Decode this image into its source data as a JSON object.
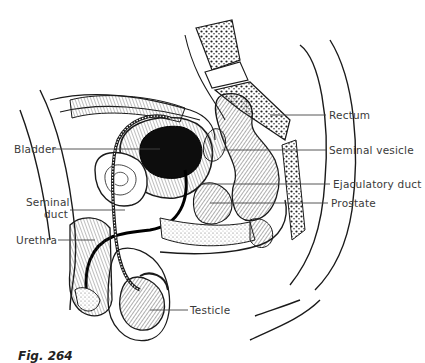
{
  "figure": {
    "caption": "Fig. 264",
    "labels": {
      "rectum": "Rectum",
      "seminal_vesicle": "Seminal vesicle",
      "ejaculatory_duct": "Ejaculatory duct",
      "prostate": "Prostate",
      "bladder": "Bladder",
      "seminal_duct_line1": "Seminal",
      "seminal_duct_line2": "duct",
      "urethra": "Urethra",
      "testicle": "Testicle"
    },
    "colors": {
      "ink": "#1a1a1a",
      "label_text": "#3a3a3a",
      "background": "#ffffff"
    }
  }
}
